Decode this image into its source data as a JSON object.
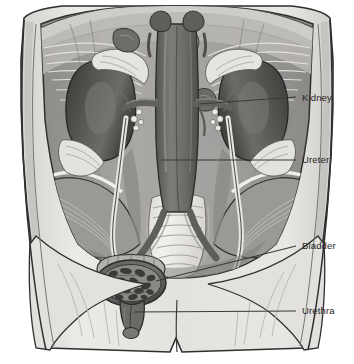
{
  "figure": {
    "background_color": "#ffffff",
    "width": 354,
    "height": 364,
    "line_color": "#3a3a3a",
    "label_color": "#252525"
  },
  "callouts": [
    {
      "id": "kidney",
      "label": "Kidney",
      "label_x": 302,
      "label_y": 92,
      "leader": {
        "x1": 199,
        "y1": 104,
        "x2": 296,
        "y2": 97
      }
    },
    {
      "id": "ureter",
      "label": "Ureter",
      "label_x": 302,
      "label_y": 154,
      "leader": {
        "x1": 161,
        "y1": 160,
        "x2": 296,
        "y2": 160
      }
    },
    {
      "id": "bladder",
      "label": "Bladder",
      "label_x": 302,
      "label_y": 240,
      "leader": {
        "x1": 156,
        "y1": 281,
        "x2": 296,
        "y2": 246
      }
    },
    {
      "id": "urethra",
      "label": "Urethra",
      "label_x": 302,
      "label_y": 305,
      "leader": {
        "x1": 134,
        "y1": 312,
        "x2": 296,
        "y2": 311
      }
    }
  ],
  "palette": {
    "skin_light": "#e4e3e1",
    "skin_shadow": "#cfcecb",
    "cavity_mid": "#a5a4a1",
    "cavity_dark": "#8e8d8a",
    "muscle": "#9b9a97",
    "fascia_light": "#dedcd8",
    "bone_light": "#efeeea",
    "organ_dark": "#4c4b49",
    "organ_darker": "#3d3c3a",
    "vessel": "#6f6e6b",
    "vessel_dark": "#5a5957",
    "outline": "#2f2f2f"
  },
  "structures": [
    {
      "name": "torso",
      "description": "abdominal torso, anterior cut-away view"
    },
    {
      "name": "diaphragm",
      "description": "upper diaphragm with radiating fibers"
    },
    {
      "name": "kidney-left",
      "description": "left kidney, dark bean shape"
    },
    {
      "name": "kidney-right",
      "description": "right kidney, dark bean shape"
    },
    {
      "name": "adrenal-gland-left",
      "description": "left suprarenal gland"
    },
    {
      "name": "adrenal-gland-right",
      "description": "right suprarenal gland"
    },
    {
      "name": "aorta",
      "description": "abdominal aorta, central vertical vessel"
    },
    {
      "name": "vena-cava",
      "description": "inferior vena cava"
    },
    {
      "name": "ureter-left",
      "description": "left ureter tube descending to bladder"
    },
    {
      "name": "ureter-right",
      "description": "right ureter tube descending to bladder"
    },
    {
      "name": "sacrum",
      "description": "sacral vertebrae, light bone"
    },
    {
      "name": "iliac-crest-left",
      "description": "left pelvic iliac bone"
    },
    {
      "name": "iliac-crest-right",
      "description": "right pelvic iliac bone"
    },
    {
      "name": "bladder",
      "description": "urinary bladder, oval mottled organ"
    },
    {
      "name": "urethra",
      "description": "urethra below bladder"
    }
  ]
}
